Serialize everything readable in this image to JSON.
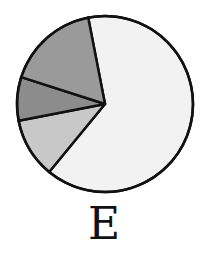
{
  "chart_data": {
    "type": "pie",
    "title": "",
    "label": "E",
    "start_angle_deg": -11,
    "direction": "clockwise",
    "slices": [
      {
        "name": "Slice 1",
        "value": 64,
        "color": "#f2f2f2"
      },
      {
        "name": "Slice 2",
        "value": 11,
        "color": "#c8c8c8"
      },
      {
        "name": "Slice 3",
        "value": 8,
        "color": "#8c8c8c"
      },
      {
        "name": "Slice 4",
        "value": 17,
        "color": "#9a9a9a"
      }
    ],
    "legend": "none"
  },
  "caption": {
    "text": "E"
  }
}
